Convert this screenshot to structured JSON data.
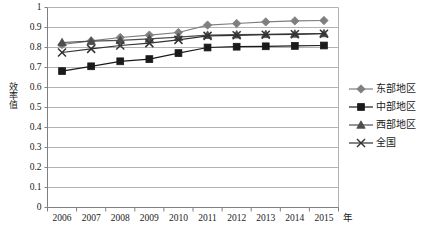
{
  "chart_data": {
    "type": "line",
    "title": "",
    "xlabel": "年",
    "ylabel": "效率值",
    "categories": [
      "2006",
      "2007",
      "2008",
      "2009",
      "2010",
      "2011",
      "2012",
      "2013",
      "2014",
      "2015"
    ],
    "ylim": [
      0,
      1
    ],
    "y_ticks": [
      "0",
      "0.1",
      "0.2",
      "0.3",
      "0.4",
      "0.5",
      "0.6",
      "0.7",
      "0.8",
      "0.9",
      "1"
    ],
    "grid": "horizontal",
    "legend_position": "right",
    "series": [
      {
        "name": "东部地区",
        "marker": "diamond",
        "color": "#7f7f7f",
        "values": [
          0.815,
          0.833,
          0.85,
          0.862,
          0.875,
          0.912,
          0.92,
          0.928,
          0.933,
          0.935
        ]
      },
      {
        "name": "中部地区",
        "marker": "square",
        "color": "#1a1a1a",
        "values": [
          0.682,
          0.706,
          0.731,
          0.742,
          0.772,
          0.8,
          0.804,
          0.806,
          0.808,
          0.81
        ]
      },
      {
        "name": "西部地区",
        "marker": "triangle",
        "color": "#4d4d4d",
        "values": [
          0.825,
          0.832,
          0.836,
          0.843,
          0.852,
          0.862,
          0.864,
          0.866,
          0.868,
          0.87
        ]
      },
      {
        "name": "全国",
        "marker": "cross",
        "color": "#333333",
        "values": [
          0.775,
          0.793,
          0.81,
          0.822,
          0.838,
          0.858,
          0.861,
          0.864,
          0.866,
          0.869
        ]
      }
    ]
  },
  "axis": {
    "y_title": "效率值",
    "x_unit": "年"
  },
  "legend": {
    "items": [
      {
        "label": "东部地区"
      },
      {
        "label": "中部地区"
      },
      {
        "label": "西部地区"
      },
      {
        "label": "全国"
      }
    ]
  }
}
